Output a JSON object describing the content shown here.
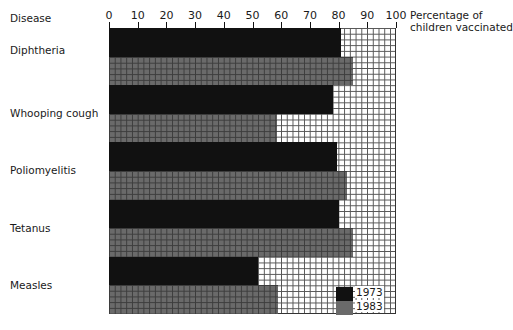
{
  "chart_data": {
    "type": "bar",
    "orientation": "horizontal",
    "title": "",
    "ylabel": "Disease",
    "xlabel": "Percentage of children vaccinated",
    "xlim": [
      0,
      100
    ],
    "xticks": [
      0,
      10,
      20,
      30,
      40,
      50,
      60,
      70,
      80,
      90,
      100
    ],
    "grid": true,
    "legend_position": "lower right inside",
    "categories": [
      "Diphtheria",
      "Whooping cough",
      "Poliomyelitis",
      "Tetanus",
      "Measles"
    ],
    "series": [
      {
        "name": "1973",
        "color": "#111111",
        "values": [
          81,
          78,
          79.5,
          80,
          52
        ]
      },
      {
        "name": "1983",
        "color": "#6a6a6a",
        "values": [
          85,
          58.5,
          83,
          85,
          59
        ]
      }
    ]
  },
  "labels": {
    "category_header": "Disease",
    "axis_title_line1": "Percentage of",
    "axis_title_line2": "children vaccinated"
  },
  "ticks": [
    "0",
    "10",
    "20",
    "30",
    "40",
    "50",
    "60",
    "70",
    "80",
    "90",
    "100"
  ],
  "legend": [
    "1973",
    "1983"
  ]
}
